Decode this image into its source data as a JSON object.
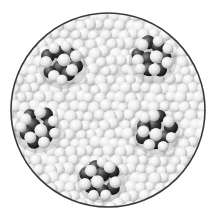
{
  "figure": {
    "circle": {
      "cx": 108,
      "cy": 110,
      "r": 97,
      "border_color": "#3a3a3a"
    },
    "colors": {
      "background_sphere_light": "#ffffff",
      "background_sphere_shadow": "#b8b8b8",
      "dark_sphere_light": "#8a8a8a",
      "dark_sphere_shadow": "#1c1c1c",
      "light_sphere_light": "#ffffff",
      "light_sphere_shadow": "#bdbdbd"
    },
    "clusters": [
      {
        "name": "cluster-top-left",
        "cx": 62,
        "cy": 64
      },
      {
        "name": "cluster-top-right",
        "cx": 152,
        "cy": 58
      },
      {
        "name": "cluster-mid-left",
        "cx": 37,
        "cy": 128
      },
      {
        "name": "cluster-mid-right",
        "cx": 155,
        "cy": 130
      },
      {
        "name": "cluster-bottom",
        "cx": 100,
        "cy": 178
      }
    ]
  }
}
